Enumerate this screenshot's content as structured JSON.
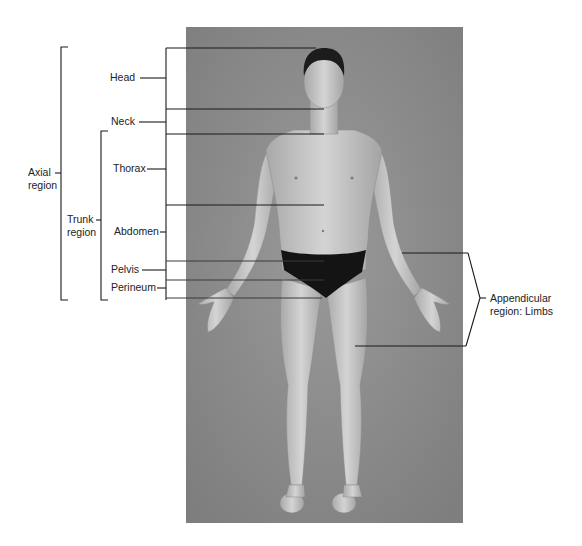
{
  "diagram": {
    "type": "anatomical-regions",
    "photo": {
      "subject": "human-body-anterior-view",
      "background": "#8f8f8f"
    },
    "labels": {
      "head": "Head",
      "neck": "Neck",
      "thorax": "Thorax",
      "abdomen": "Abdomen",
      "pelvis": "Pelvis",
      "perineum": "Perineum",
      "axial_line1": "Axial",
      "axial_line2": "region",
      "trunk_line1": "Trunk",
      "trunk_line2": "region",
      "appendicular_line1": "Appendicular",
      "appendicular_line2": "region: Limbs"
    },
    "groups": [
      {
        "name": "Axial region",
        "members": [
          "Head",
          "Neck",
          "Thorax",
          "Abdomen",
          "Pelvis",
          "Perineum"
        ]
      },
      {
        "name": "Trunk region",
        "members": [
          "Thorax",
          "Abdomen",
          "Pelvis",
          "Perineum"
        ]
      },
      {
        "name": "Appendicular region: Limbs",
        "members": [
          "upper limb",
          "lower limb"
        ]
      }
    ],
    "colors": {
      "line": "#1a1a1a",
      "text": "#222222",
      "photo_bg": "#8f8f8f",
      "skin": "#c9c9c9",
      "briefs": "#141414",
      "hair": "#1c1c1c"
    }
  }
}
